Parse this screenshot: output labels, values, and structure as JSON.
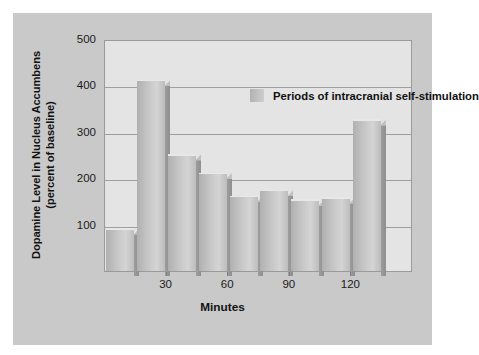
{
  "figure": {
    "background": "#ffffff",
    "panel_color": "#c9c9c9",
    "plot_background": "#e4e4e4"
  },
  "chart_data": {
    "type": "bar",
    "title": "",
    "xlabel": "Minutes",
    "ylabel": "Dopamine Level in Nucleus Accumbens (percent of baseline)",
    "ylabel_line1": "Dopamine Level in Nucleus Accumbens",
    "ylabel_line2": "(percent of baseline)",
    "ylim": [
      0,
      500
    ],
    "yticks": [
      100,
      200,
      300,
      400,
      500
    ],
    "ytick_labels": [
      "100",
      "200",
      "300",
      "400",
      "500"
    ],
    "xticks": [
      30,
      60,
      90,
      120
    ],
    "xtick_labels": [
      "30",
      "60",
      "90",
      "120"
    ],
    "xlim": [
      0,
      150
    ],
    "grid": true,
    "bar_color": "#c4c4c4",
    "x": [
      7.5,
      22.5,
      37.5,
      52.5,
      67.5,
      82.5,
      97.5,
      112.5,
      127.5
    ],
    "values": [
      90,
      410,
      250,
      210,
      160,
      173,
      152,
      157,
      325
    ],
    "categories": [
      "0-15",
      "15-30",
      "30-45",
      "45-60",
      "60-75",
      "75-90",
      "90-105",
      "105-120",
      "120-135"
    ],
    "legend": {
      "position": "inside-top-center",
      "entries": [
        {
          "label": "Periods of intracranial self-stimulation",
          "color": "#c4c4c4"
        }
      ]
    }
  }
}
